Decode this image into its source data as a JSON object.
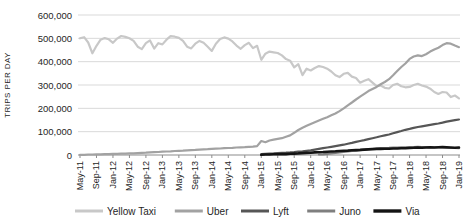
{
  "chart_data": {
    "type": "line",
    "title": "",
    "xlabel": "",
    "ylabel": "TRIPS PER DAY",
    "unit": "trips per day",
    "x_interval": "monthly",
    "x_range": [
      "May-2011",
      "Jan-2019"
    ],
    "x_tick_labels": [
      "May-11",
      "Sep-11",
      "Jan-12",
      "May-12",
      "Sep-12",
      "Jan-13",
      "May-13",
      "Sep-13",
      "Jan-14",
      "May-14",
      "Sep-14",
      "Jan-15",
      "May-15",
      "Sep-15",
      "Jan-16",
      "May-16",
      "Sep-16",
      "Jan-17",
      "May-17",
      "Sep-17",
      "Jan-18",
      "May-18",
      "Sep-18",
      "Jan-19"
    ],
    "x_ticks_every_n_points": 4,
    "ylim": [
      0,
      600000
    ],
    "y_ticks": {
      "values": [
        0,
        100000,
        200000,
        300000,
        400000,
        500000,
        600000
      ],
      "labels": [
        "0",
        "100,000",
        "200,000",
        "300,000",
        "400,000",
        "500,000",
        "600,000"
      ]
    },
    "grid": "horizontal",
    "legend_position": "bottom",
    "series": [
      {
        "name": "Yellow Taxi",
        "color": "#c8c8c8",
        "values": [
          500000,
          505000,
          482000,
          436000,
          468000,
          494000,
          501000,
          496000,
          481000,
          499000,
          510000,
          506000,
          500000,
          489000,
          464000,
          454000,
          479000,
          491000,
          456000,
          479000,
          474000,
          494000,
          509000,
          507000,
          502000,
          489000,
          464000,
          457000,
          477000,
          489000,
          481000,
          464000,
          446000,
          477000,
          497000,
          504000,
          499000,
          487000,
          469000,
          455000,
          471000,
          481000,
          458000,
          468000,
          408000,
          434000,
          443000,
          440000,
          437000,
          427000,
          411000,
          404000,
          376000,
          389000,
          342000,
          370000,
          362000,
          373000,
          381000,
          377000,
          370000,
          358000,
          342000,
          334000,
          348000,
          352000,
          336000,
          330000,
          310000,
          318000,
          325000,
          310000,
          295000,
          298000,
          288000,
          285000,
          300000,
          305000,
          295000,
          290000,
          292000,
          300000,
          305000,
          298000,
          293000,
          284000,
          270000,
          262000,
          270000,
          268000,
          248000,
          255000,
          243000
        ]
      },
      {
        "name": "Uber",
        "color": "#a2a2a2",
        "values": [
          1000,
          1000,
          2000,
          2000,
          3000,
          3000,
          4000,
          4000,
          5000,
          5000,
          6000,
          6000,
          7000,
          7000,
          8000,
          9000,
          10000,
          11000,
          12000,
          13000,
          14000,
          15000,
          16000,
          17000,
          18000,
          19000,
          20000,
          21000,
          22000,
          23000,
          24000,
          25000,
          26000,
          27000,
          28000,
          29000,
          30000,
          31000,
          32000,
          33000,
          34000,
          35000,
          36000,
          38000,
          60000,
          55000,
          62000,
          66000,
          69000,
          72000,
          78000,
          84000,
          95000,
          107000,
          117000,
          125000,
          133000,
          140000,
          148000,
          155000,
          162000,
          170000,
          178000,
          188000,
          200000,
          213000,
          225000,
          238000,
          250000,
          262000,
          274000,
          283000,
          292000,
          303000,
          313000,
          325000,
          342000,
          360000,
          377000,
          392000,
          412000,
          422000,
          427000,
          424000,
          432000,
          443000,
          452000,
          460000,
          471000,
          479000,
          477000,
          469000,
          462000
        ]
      },
      {
        "name": "Lyft",
        "color": "#565656",
        "values": [
          null,
          null,
          null,
          null,
          null,
          null,
          null,
          null,
          null,
          null,
          null,
          null,
          null,
          null,
          null,
          null,
          null,
          null,
          null,
          null,
          null,
          null,
          null,
          null,
          null,
          null,
          null,
          null,
          null,
          null,
          null,
          null,
          null,
          null,
          null,
          null,
          null,
          null,
          null,
          null,
          null,
          null,
          null,
          null,
          4000,
          5000,
          6000,
          7000,
          8000,
          9000,
          10000,
          11000,
          13000,
          15000,
          16000,
          18000,
          20000,
          23000,
          26000,
          29000,
          32000,
          35000,
          38000,
          41000,
          44000,
          48000,
          52000,
          56000,
          60000,
          64000,
          68000,
          72000,
          76000,
          80000,
          84000,
          88000,
          93000,
          98000,
          103000,
          108000,
          112000,
          116000,
          120000,
          123000,
          126000,
          129000,
          132000,
          135000,
          139000,
          143000,
          146000,
          149000,
          152000
        ]
      },
      {
        "name": "Juno",
        "color": "#7f7f7f",
        "values": [
          null,
          null,
          null,
          null,
          null,
          null,
          null,
          null,
          null,
          null,
          null,
          null,
          null,
          null,
          null,
          null,
          null,
          null,
          null,
          null,
          null,
          null,
          null,
          null,
          null,
          null,
          null,
          null,
          null,
          null,
          null,
          null,
          null,
          null,
          null,
          null,
          null,
          null,
          null,
          null,
          null,
          null,
          null,
          null,
          null,
          null,
          null,
          null,
          null,
          null,
          null,
          null,
          null,
          null,
          null,
          null,
          null,
          null,
          2000,
          3000,
          5000,
          7000,
          9000,
          11000,
          13000,
          15000,
          17000,
          19000,
          21000,
          23000,
          25000,
          27000,
          28000,
          29000,
          30000,
          31000,
          32000,
          32000,
          33000,
          33000,
          34000,
          34000,
          35000,
          34000,
          34000,
          33000,
          33000,
          32000,
          32000,
          31000,
          30000,
          30000,
          29000
        ]
      },
      {
        "name": "Via",
        "color": "#141414",
        "values": [
          null,
          null,
          null,
          null,
          null,
          null,
          null,
          null,
          null,
          null,
          null,
          null,
          null,
          null,
          null,
          null,
          null,
          null,
          null,
          null,
          null,
          null,
          null,
          null,
          null,
          null,
          null,
          null,
          null,
          null,
          null,
          null,
          null,
          null,
          null,
          null,
          null,
          null,
          null,
          null,
          null,
          null,
          null,
          null,
          1000,
          2000,
          2000,
          3000,
          3000,
          4000,
          4000,
          5000,
          6000,
          7000,
          8000,
          9000,
          10000,
          11000,
          12000,
          13000,
          14000,
          15000,
          16000,
          17000,
          18000,
          19000,
          20000,
          21000,
          22000,
          23000,
          24000,
          25000,
          26000,
          26000,
          27000,
          27000,
          28000,
          28000,
          29000,
          29000,
          30000,
          31000,
          32000,
          31000,
          32000,
          33000,
          32000,
          33000,
          34000,
          33000,
          32000,
          31000,
          32000
        ]
      }
    ]
  },
  "colors": {
    "gridline": "#d9d9d9",
    "axis_line": "#8c8c8c",
    "tick_mark": "#8c8c8c",
    "text": "#262626",
    "background": "#ffffff"
  }
}
